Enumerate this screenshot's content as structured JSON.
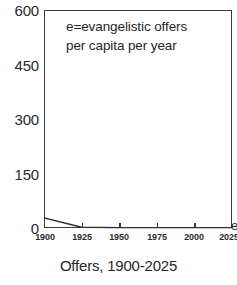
{
  "chart_data": {
    "type": "line",
    "title": "",
    "caption": "Offers, 1900-2025",
    "annotation": "e=evangelistic offers\nper capita per year",
    "annotation_lines": [
      "e=evangelistic offers",
      "per capita per year"
    ],
    "xlabel": "",
    "ylabel": "",
    "xlim": [
      1900,
      2025
    ],
    "ylim": [
      0,
      600
    ],
    "grid": false,
    "legend": false,
    "frame": true,
    "x_ticks": [
      1900,
      1925,
      1950,
      1975,
      2000,
      2025
    ],
    "x_tick_labels": [
      "1900",
      "1925",
      "1950",
      "1975",
      "2000",
      "2025"
    ],
    "y_ticks": [
      0,
      150,
      300,
      450,
      600
    ],
    "y_tick_labels": [
      "0",
      "150",
      "300",
      "450",
      "600"
    ],
    "x": [
      1900,
      1925,
      1950,
      1975,
      2000,
      2025
    ],
    "values": [
      28,
      2,
      1,
      1,
      1,
      1
    ],
    "series": [
      {
        "name": "e",
        "x": [
          1900,
          1925,
          1950,
          1975,
          2000,
          2025
        ],
        "values": [
          28,
          2,
          1,
          1,
          1,
          1
        ],
        "color": "#2b2b2b"
      }
    ],
    "edge_glyph": "e",
    "line_color": "#2b2b2b",
    "axis_color": "#3a3a3a",
    "background": "#ffffff",
    "text_color": "#272727"
  }
}
